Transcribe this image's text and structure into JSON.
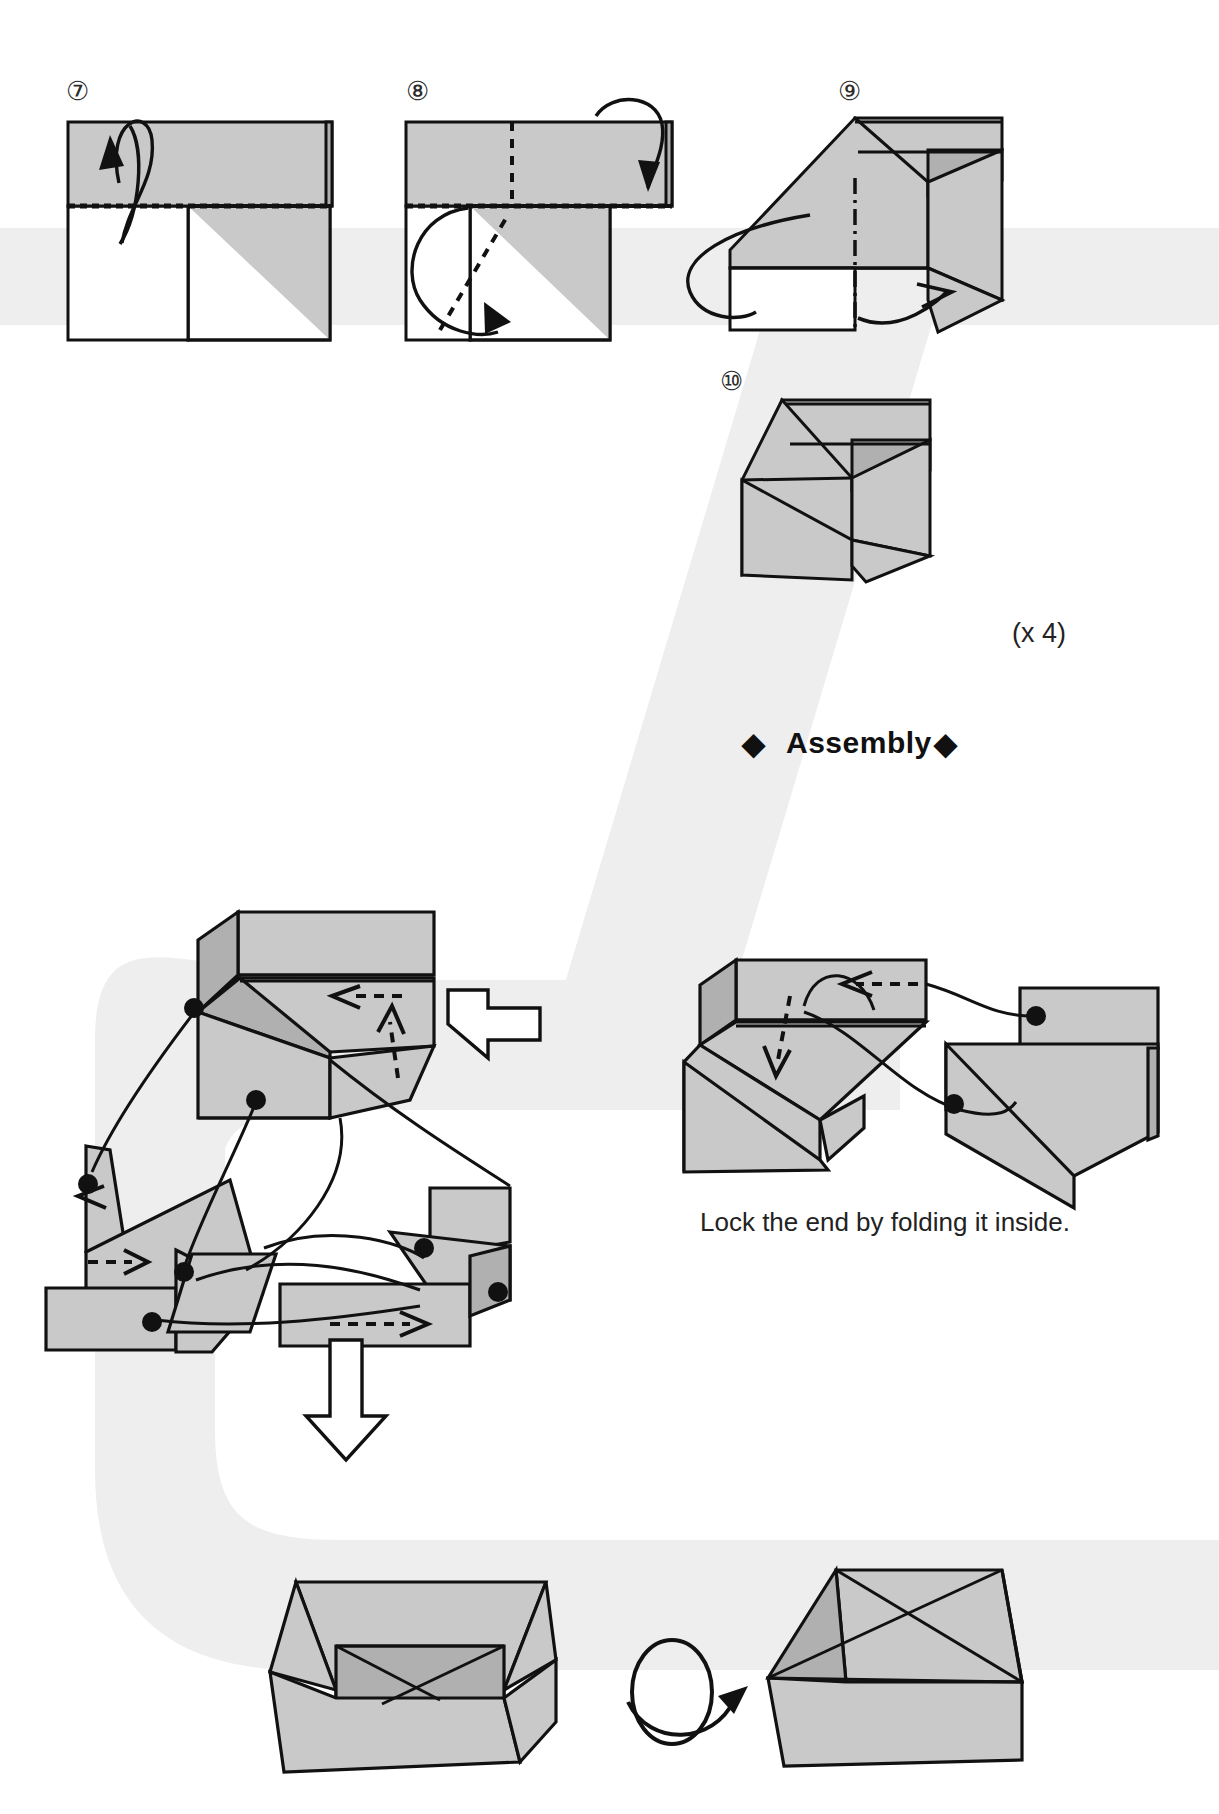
{
  "page": {
    "kind": "origami-instruction-diagram",
    "background": "#ffffff",
    "watermark_color": "#eeeeee",
    "paper_front_color": "#c9c9c9",
    "paper_shadow_color": "#b0b0b0",
    "paper_back_color": "#ffffff",
    "ink_color": "#111111"
  },
  "steps": [
    {
      "id": "step-7",
      "number_glyph": "⑦",
      "label": "7",
      "x": 66,
      "y": 78
    },
    {
      "id": "step-8",
      "number_glyph": "⑧",
      "label": "8",
      "x": 406,
      "y": 78
    },
    {
      "id": "step-9",
      "number_glyph": "⑨",
      "label": "9",
      "x": 838,
      "y": 78
    },
    {
      "id": "step-10",
      "number_glyph": "⑩",
      "label": "10",
      "x": 722,
      "y": 367
    }
  ],
  "labels": {
    "repeat_count": "(x 4)",
    "assembly_heading": "Assembly",
    "assembly_diamond_left": "◆",
    "assembly_diamond_right": "◆",
    "lock_caption": "Lock the end by folding it inside."
  },
  "annotations": {
    "fold_behind_arrow": "fold-behind-arrow",
    "valley_fold_arrow": "valley-fold-arrow",
    "wrap_around_arrow": "wrap-around-arrow",
    "rotate_arrow": "rotate-arrow",
    "turn_over_arrow": "turn-over-arrow",
    "big_left_block_arrow": "left-block-arrow",
    "big_down_block_arrow": "down-block-arrow",
    "insert_arrow": "insert-dashed-arrow"
  }
}
